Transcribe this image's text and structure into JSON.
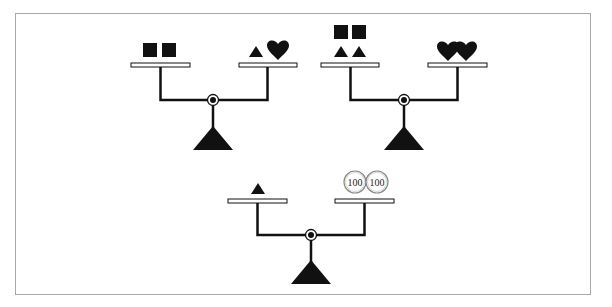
{
  "figure": {
    "type": "balance-scale-puzzle",
    "colors": {
      "ink": "#111111",
      "frame_border": "#a8a8a8",
      "pan_fill": "#ffffff",
      "coin_border": "#888888",
      "background": "#ffffff"
    },
    "scales": [
      {
        "id": "scale-1",
        "left_pan": [
          "square",
          "square"
        ],
        "right_pan": [
          "triangle",
          "heart"
        ],
        "state": "balanced"
      },
      {
        "id": "scale-2",
        "left_pan": [
          "square",
          "square",
          "triangle",
          "triangle"
        ],
        "right_pan": [
          "heart",
          "heart"
        ],
        "state": "balanced"
      },
      {
        "id": "scale-3",
        "left_pan": [
          "triangle"
        ],
        "right_pan": [
          "coin-100",
          "coin-100"
        ],
        "state": "balanced"
      }
    ],
    "coins": [
      {
        "label": "100"
      },
      {
        "label": "100"
      }
    ]
  }
}
